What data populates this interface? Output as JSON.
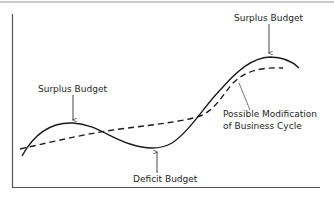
{
  "diagram": {
    "type": "business-cycle-line-diagram",
    "frame_color": "#8a8a8a",
    "line_color": "#1a1a1a",
    "labels": {
      "surplus_top": "Surplus Budget",
      "surplus_left": "Surplus Budget",
      "deficit": "Deficit Budget",
      "modification_line1": "Possible Modification",
      "modification_line2": "of Business Cycle"
    },
    "series": [
      {
        "name": "Business Cycle",
        "style": "solid"
      },
      {
        "name": "Possible Modification of Business Cycle",
        "style": "dashed"
      }
    ]
  }
}
